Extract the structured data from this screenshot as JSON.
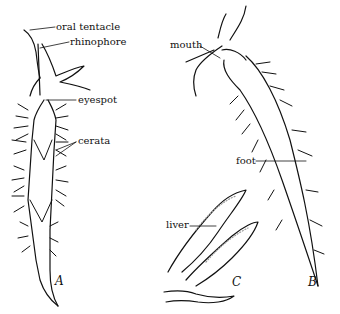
{
  "figure": {
    "panels": [
      {
        "id": "A",
        "label": "A"
      },
      {
        "id": "B",
        "label": "B"
      },
      {
        "id": "C",
        "label": "C"
      }
    ],
    "labels": {
      "oral_tentacle": "oral tentacle",
      "rhinophore": "rhinophore",
      "eyespot": "eyespot",
      "cerata": "cerata",
      "mouth": "mouth",
      "foot": "foot",
      "liver": "liver"
    },
    "colors": {
      "ink": "#111111",
      "background": "#ffffff",
      "stipple": "#bdbdbd"
    }
  }
}
